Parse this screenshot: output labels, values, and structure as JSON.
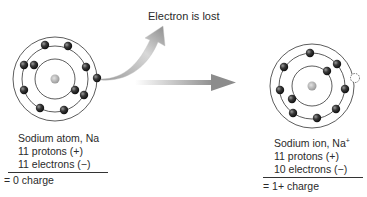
{
  "caption": "Electron is lost",
  "colors": {
    "orbit": "#333333",
    "electron": "#2b2b2b",
    "nucleus": "#a8a8a8",
    "arrow_light": "#e6e6e6",
    "arrow_dark": "#8a8a8a"
  },
  "atom": {
    "title": "Sodium atom, Na",
    "protons": "11 protons (+)",
    "electrons": "11 electrons (−)",
    "charge": "= 0 charge"
  },
  "ion": {
    "title_prefix": "Sodium ion, Na",
    "title_sup": "+",
    "protons": "11 protons (+)",
    "electrons": "10 electrons (−)",
    "charge": "= 1+ charge"
  }
}
